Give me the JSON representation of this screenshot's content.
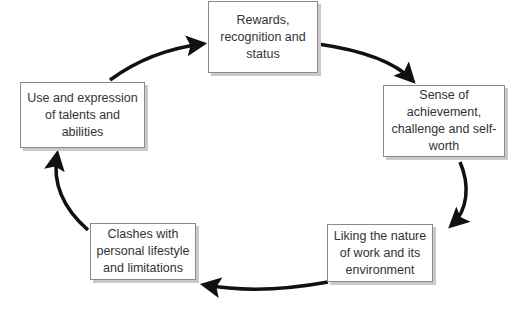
{
  "diagram": {
    "type": "cycle",
    "nodes": [
      {
        "id": "rewards",
        "label": "Rewards, recognition and status"
      },
      {
        "id": "achievement",
        "label": "Sense of achievement, challenge and self-worth"
      },
      {
        "id": "liking",
        "label": "Liking the nature of work and its environment"
      },
      {
        "id": "clashes",
        "label": "Clashes with personal lifestyle and limitations"
      },
      {
        "id": "talents",
        "label": "Use and expression of talents and abilities"
      }
    ],
    "edges": [
      {
        "from": "rewards",
        "to": "achievement"
      },
      {
        "from": "achievement",
        "to": "liking"
      },
      {
        "from": "liking",
        "to": "clashes"
      },
      {
        "from": "clashes",
        "to": "talents"
      },
      {
        "from": "talents",
        "to": "rewards"
      }
    ],
    "colors": {
      "arrow": "#111111",
      "border": "#8a8a8a",
      "shadow": "#c9c9c9",
      "text": "#333333"
    }
  }
}
